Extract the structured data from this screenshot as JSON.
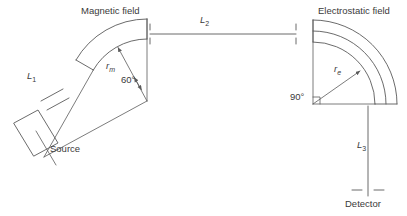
{
  "figure": {
    "type": "schematic-diagram",
    "background_color": "#ffffff",
    "stroke_color": "#5a5a5a",
    "text_color": "#3a3a3a",
    "width": 407,
    "height": 216
  },
  "labels": {
    "magnetic_field": "Magnetic field",
    "electrostatic_field": "Electrostatic field",
    "source": "Source",
    "detector": "Detector",
    "angle_magnetic": "60°",
    "angle_electrostatic": "90°",
    "radius_magnetic_base": "r",
    "radius_magnetic_sub": "m",
    "radius_electrostatic_base": "r",
    "radius_electrostatic_sub": "e",
    "path_l1_base": "L",
    "path_l1_sub": "1",
    "path_l2_base": "L",
    "path_l2_sub": "2",
    "path_l3_base": "L",
    "path_l3_sub": "3"
  },
  "geometry": {
    "magnetic_sector": {
      "apex_x": 147,
      "apex_y": 101,
      "sector_angle_deg": 60,
      "inner_radius": 62,
      "outer_radius": 82,
      "radius_arrow_label_value": "r_m"
    },
    "electrostatic_sector": {
      "corner_x": 313,
      "corner_y": 104,
      "sector_angle_deg": 90,
      "inner_radius": 62,
      "outer_radius": 84,
      "radius_arrow_label_value": "r_e"
    },
    "flight_path_l2": {
      "y": 34,
      "x_start": 150,
      "x_end": 296
    },
    "flight_path_l3": {
      "x": 368,
      "y_start": 106,
      "y_end": 196
    }
  },
  "annotations": {
    "tick_marks": [
      {
        "name": "l2-left-tick",
        "x": 150,
        "y": 34
      },
      {
        "name": "l2-right-tick",
        "x": 296,
        "y": 34
      },
      {
        "name": "l3-bottom-tick",
        "x": 368,
        "y": 190
      }
    ]
  }
}
